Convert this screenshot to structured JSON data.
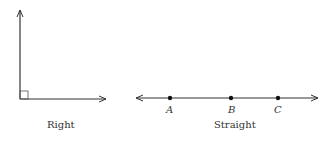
{
  "figures": [
    {
      "id": "right",
      "label": "Right"
    },
    {
      "id": "straight",
      "label": "Straight",
      "points": [
        "A",
        "B",
        "C"
      ]
    }
  ],
  "colors": {
    "stroke": "#333333"
  }
}
